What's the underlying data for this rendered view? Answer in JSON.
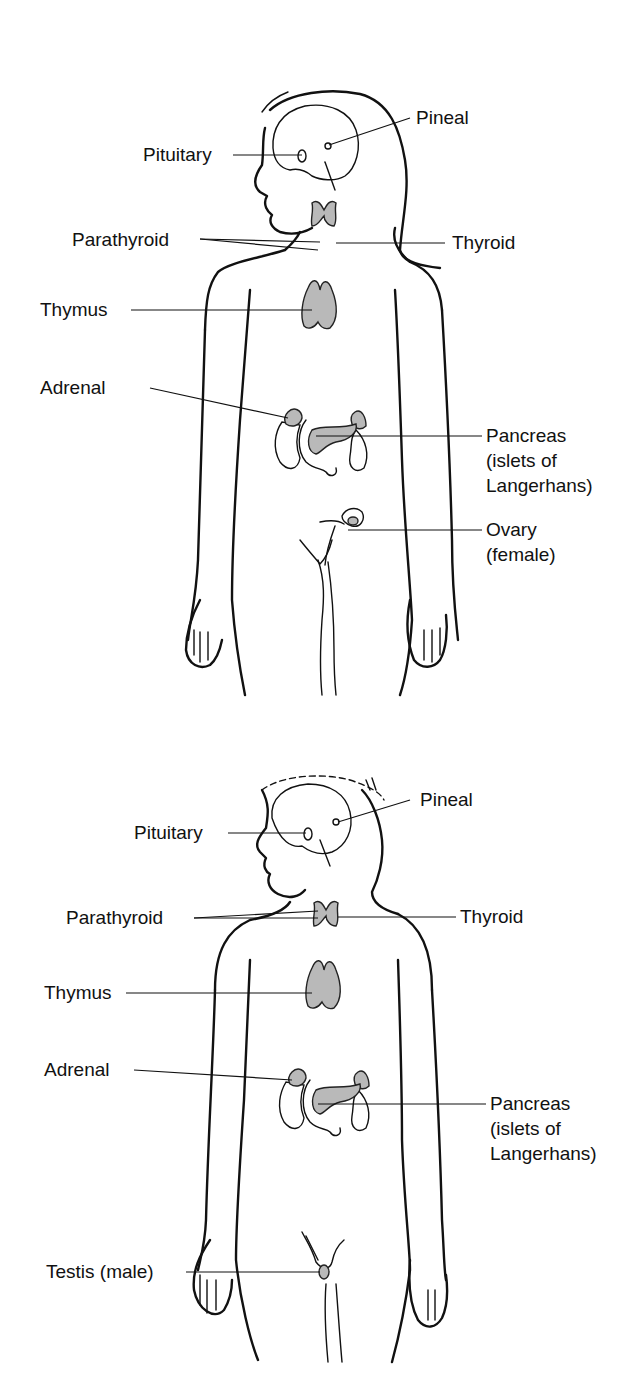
{
  "figures": [
    {
      "name": "female",
      "labels": {
        "pineal": "Pineal",
        "pituitary": "Pituitary",
        "parathyroid": "Parathyroid",
        "thyroid": "Thyroid",
        "thymus": "Thymus",
        "adrenal": "Adrenal",
        "pancreas_1": "Pancreas",
        "pancreas_2": "(islets of",
        "pancreas_3": "Langerhans)",
        "gonad_1": "Ovary",
        "gonad_2": "(female)"
      }
    },
    {
      "name": "male",
      "labels": {
        "pineal": "Pineal",
        "pituitary": "Pituitary",
        "parathyroid": "Parathyroid",
        "thyroid": "Thyroid",
        "thymus": "Thymus",
        "adrenal": "Adrenal",
        "pancreas_1": "Pancreas",
        "pancreas_2": "(islets of",
        "pancreas_3": "Langerhans)",
        "gonad_1": "Testis (male)"
      }
    }
  ],
  "colors": {
    "gland_fill": "#b9b9b9",
    "line": "#111111"
  }
}
